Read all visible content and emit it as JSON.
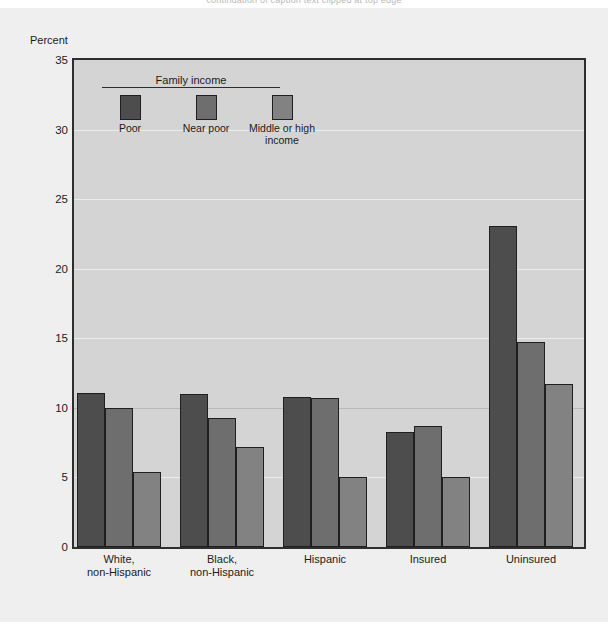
{
  "top_clip_text": "continuation of caption text clipped at top edge",
  "chart_data": {
    "type": "bar",
    "title": "",
    "xlabel": "",
    "ylabel": "Percent",
    "ylim": [
      0,
      35
    ],
    "yticks": [
      0,
      5,
      10,
      15,
      20,
      25,
      30,
      35
    ],
    "grid": true,
    "legend_position": "inside-top-left",
    "legend_title": "Family income",
    "categories": [
      "White,\nnon-Hispanic",
      "Black,\nnon-Hispanic",
      "Hispanic",
      "Insured",
      "Uninsured"
    ],
    "series": [
      {
        "name": "Poor",
        "color": "#4d4d4d",
        "values": [
          11.1,
          11.0,
          10.8,
          8.3,
          23.1
        ]
      },
      {
        "name": "Near\npoor",
        "color": "#6e6e6e",
        "values": [
          10.0,
          9.3,
          10.7,
          8.7,
          14.7
        ]
      },
      {
        "name": "Middle or\nhigh income",
        "color": "#828282",
        "values": [
          5.4,
          7.2,
          5.0,
          5.0,
          11.7
        ]
      }
    ]
  },
  "colors": {
    "page_background": "#ffffff",
    "figure_background": "#efefef",
    "plot_background": "#d4d4d4",
    "axis": "#2e2e2e",
    "text": "#1b1b1b"
  }
}
